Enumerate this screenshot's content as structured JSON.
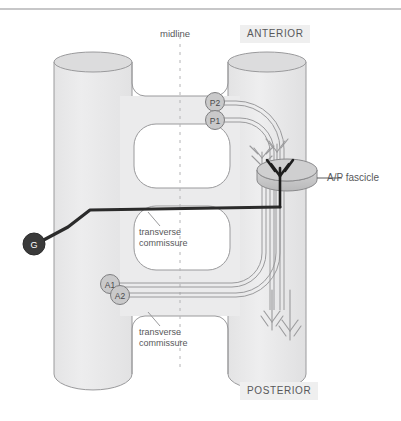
{
  "figure": {
    "type": "neuroanatomy-schematic"
  },
  "orientation": {
    "anterior": "ANTERIOR",
    "posterior": "POSTERIOR",
    "midline": "midline"
  },
  "structures": {
    "commissure_upper": "transverse\ncommissure",
    "commissure_upper_line1": "transverse",
    "commissure_upper_line2": "commissure",
    "commissure_lower_line1": "transverse",
    "commissure_lower_line2": "commissure",
    "fascicle": "A/P fascicle"
  },
  "neurons": {
    "p2": "P2",
    "p1": "P1",
    "a1": "A1",
    "a2": "A2",
    "g": "G"
  },
  "colors": {
    "cord_fill": "#ebebec",
    "cord_stroke": "#9a9a9c",
    "cord_cap": "#dcdcdd",
    "axon_gray": "#9a9a9c",
    "axon_dark": "#2b2b2b",
    "soma_fill": "#3a3a3a",
    "node_fill": "#c9c9ca",
    "label_bg": "#efefef",
    "text": "#58585a",
    "rule": "#8f8f91"
  }
}
